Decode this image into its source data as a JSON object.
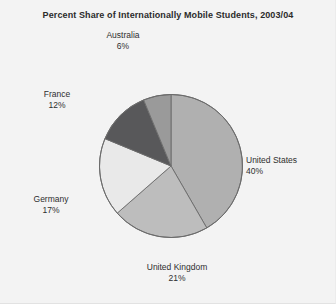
{
  "chart_data": {
    "type": "pie",
    "title": "Percent Share of Internationally Mobile Students, 2003/04",
    "xlabel": "",
    "ylabel": "",
    "legend": "none",
    "grid": false,
    "units": "percent",
    "start_angle_deg": 0,
    "direction": "clockwise",
    "categories": [
      "United States",
      "United Kingdom",
      "Germany",
      "France",
      "Australia"
    ],
    "values": [
      40,
      21,
      17,
      12,
      6
    ],
    "slices": [
      {
        "label": "United States",
        "value": 40,
        "value_text": "40%",
        "color": "#b0b0b0"
      },
      {
        "label": "United Kingdom",
        "value": 21,
        "value_text": "21%",
        "color": "#bdbdbd"
      },
      {
        "label": "Germany",
        "value": 17,
        "value_text": "17%",
        "color": "#e9e9e9"
      },
      {
        "label": "France",
        "value": 12,
        "value_text": "12%",
        "color": "#58585a"
      },
      {
        "label": "Australia",
        "value": 6,
        "value_text": "6%",
        "color": "#9a9a9a"
      }
    ]
  },
  "figure": {
    "background": "#f3f3f3",
    "outline_color": "#6b6b6b",
    "text_color": "#2e2e2e"
  }
}
